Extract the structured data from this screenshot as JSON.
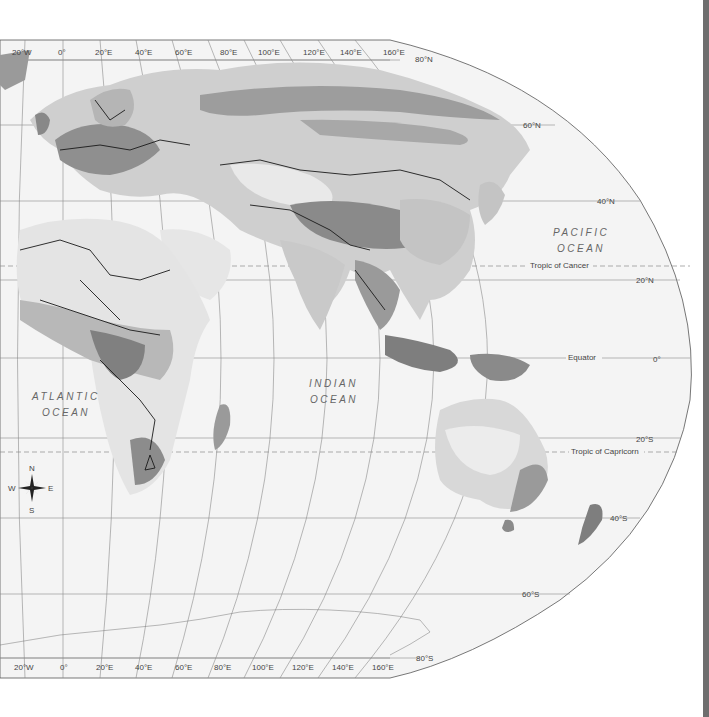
{
  "map": {
    "projection": "world map (Eastern Hemisphere, elliptical)",
    "colors": {
      "ocean": "#f4f4f4",
      "land_light": "#e6e6e6",
      "land_lighter": "#d4d4d4",
      "land_mid": "#b9b9b9",
      "land_dark": "#9a9a9a",
      "land_darkest": "#7b7b7b",
      "border": "#1a1a1a",
      "graticule": "#8a8a8a"
    },
    "top_longitudes": [
      "20°W",
      "0°",
      "20°E",
      "40°E",
      "60°E",
      "80°E",
      "100°E",
      "120°E",
      "140°E",
      "160°E"
    ],
    "bottom_longitudes": [
      "20°W",
      "0°",
      "20°E",
      "40°E",
      "60°E",
      "80°E",
      "100°E",
      "120°E",
      "140°E",
      "160°E"
    ],
    "latitudes": {
      "n80": "80°N",
      "n60": "60°N",
      "n40": "40°N",
      "n20": "20°N",
      "eq": "0°",
      "s20": "20°S",
      "s40": "40°S",
      "s60": "60°S",
      "s80": "80°S"
    },
    "special_lines": {
      "tropic_cancer": "Tropic of Cancer",
      "equator": "Equator",
      "tropic_capricorn": "Tropic of Capricorn"
    },
    "oceans": {
      "pacific_line1": "PACIFIC",
      "pacific_line2": "OCEAN",
      "atlantic_line1": "ATLANTIC",
      "atlantic_line2": "OCEAN",
      "indian_line1": "INDIAN",
      "indian_line2": "OCEAN"
    },
    "compass": {
      "n": "N",
      "s": "S",
      "e": "E",
      "w": "W"
    }
  }
}
